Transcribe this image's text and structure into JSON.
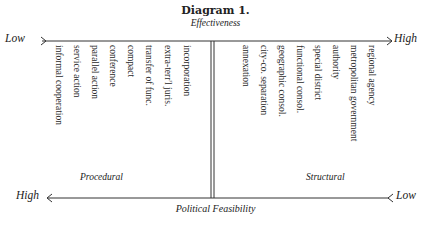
{
  "diagram": {
    "title": "Diagram 1.",
    "top_axis": {
      "label": "Effectiveness",
      "left_end": "Low",
      "right_end": "High"
    },
    "bottom_axis": {
      "label": "Political Feasibility",
      "left_end": "High",
      "right_end": "Low"
    },
    "groups": [
      {
        "name": "Procedural",
        "items": [
          "informal cooperation",
          "service action",
          "parallel action",
          "conference",
          "compact",
          "transfer of func.",
          "extra-terr'l juris.",
          "incorporation"
        ]
      },
      {
        "name": "Structural",
        "items": [
          "annexation",
          "city-co. separation",
          "geographic consol.",
          "functional consol.",
          "special district",
          "authority",
          "metropolitan government",
          "regional agency"
        ]
      }
    ],
    "line_color": "#333333"
  }
}
